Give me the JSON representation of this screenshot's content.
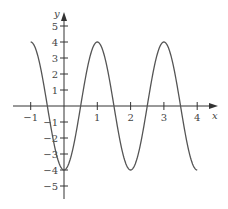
{
  "chart_data": {
    "type": "line",
    "title": "",
    "xlabel": "x",
    "ylabel": "y",
    "xlim": [
      -1.1,
      4.4
    ],
    "ylim": [
      -5.8,
      5.8
    ],
    "grid": false,
    "legend": null,
    "x_ticks": [
      -1,
      1,
      2,
      3,
      4
    ],
    "x_tick_labels": [
      "−1",
      "1",
      "2",
      "3",
      "4"
    ],
    "y_ticks": [
      5,
      4,
      3,
      2,
      1,
      -1,
      -2,
      -3,
      -4,
      -5
    ],
    "y_tick_labels": [
      "5",
      "4",
      "3",
      "2",
      "1",
      "−1",
      "−2",
      "−3",
      "−4",
      "−5"
    ],
    "series": [
      {
        "name": "y = -4cos(πx)",
        "color": "#555555",
        "x": [
          -1,
          -0.5,
          0,
          0.5,
          1,
          1.5,
          2,
          2.5,
          3,
          3.5,
          4
        ],
        "values": [
          4,
          0,
          -4,
          0,
          4,
          0,
          -4,
          0,
          4,
          0,
          -4
        ]
      }
    ]
  },
  "colors": {
    "axis": "#333333",
    "curve": "#555555"
  }
}
